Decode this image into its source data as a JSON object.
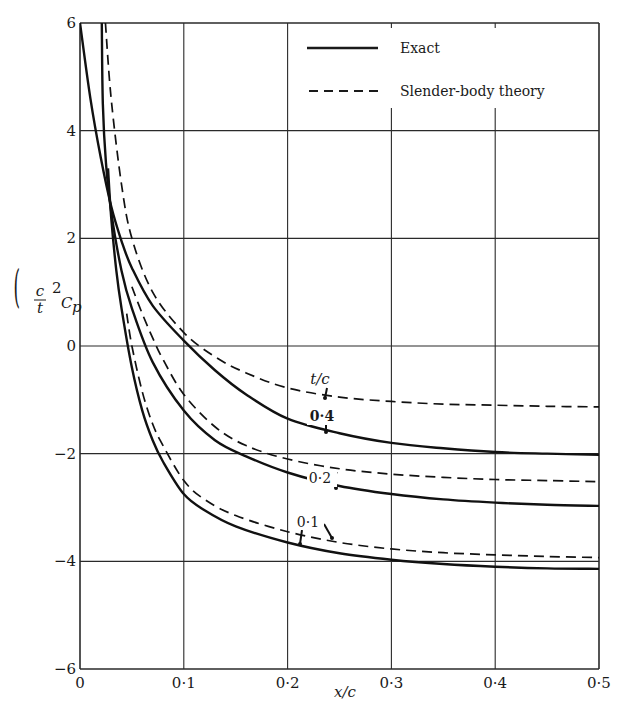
{
  "chart_data": {
    "type": "line",
    "title": "",
    "xlabel": "x/c",
    "ylabel": "(c/t)^2 C_p",
    "xlim": [
      0,
      0.5
    ],
    "ylim": [
      -6,
      6
    ],
    "grid": true,
    "x_ticks": [
      "0",
      "0·1",
      "0·2",
      "0·3",
      "0·4",
      "0·5"
    ],
    "y_ticks": [
      "6",
      "4",
      "2",
      "0",
      "−2",
      "−4",
      "−6"
    ],
    "legend": {
      "position": "upper right",
      "entries": [
        {
          "label": "Exact",
          "style": "solid"
        },
        {
          "label": "Slender-body theory",
          "style": "dashed"
        }
      ]
    },
    "annotations": [
      {
        "text": "t/c",
        "x": 0.235,
        "y": -0.6
      },
      {
        "text": "0·4",
        "x": 0.235,
        "y": -1.2
      },
      {
        "text": "0·2",
        "x": 0.22,
        "y": -2.8
      },
      {
        "text": "0·1",
        "x": 0.215,
        "y": -3.6
      }
    ],
    "series": [
      {
        "name": "Exact t/c=0.4",
        "style": "solid",
        "x": [
          0.0,
          0.01,
          0.02,
          0.03,
          0.04,
          0.05,
          0.07,
          0.1,
          0.13,
          0.16,
          0.2,
          0.25,
          0.3,
          0.35,
          0.4,
          0.45,
          0.5
        ],
        "values": [
          6.0,
          4.6,
          3.5,
          2.6,
          1.95,
          1.45,
          0.75,
          0.1,
          -0.45,
          -0.9,
          -1.35,
          -1.62,
          -1.8,
          -1.9,
          -1.97,
          -2.0,
          -2.02
        ]
      },
      {
        "name": "Slender-body t/c=0.4",
        "style": "dashed",
        "x": [
          0.0245,
          0.03,
          0.04,
          0.05,
          0.07,
          0.1,
          0.13,
          0.16,
          0.2,
          0.25,
          0.3,
          0.35,
          0.4,
          0.45,
          0.5
        ],
        "values": [
          6.0,
          4.6,
          3.0,
          2.0,
          1.0,
          0.25,
          -0.2,
          -0.5,
          -0.78,
          -0.95,
          -1.03,
          -1.08,
          -1.1,
          -1.12,
          -1.13
        ]
      },
      {
        "name": "Exact t/c=0.2",
        "style": "solid",
        "x": [
          0.021,
          0.022,
          0.025,
          0.03,
          0.04,
          0.05,
          0.07,
          0.1,
          0.13,
          0.16,
          0.2,
          0.25,
          0.3,
          0.35,
          0.4,
          0.45,
          0.5
        ],
        "values": [
          6.0,
          4.5,
          3.4,
          2.5,
          1.4,
          0.7,
          -0.3,
          -1.2,
          -1.75,
          -2.05,
          -2.35,
          -2.6,
          -2.75,
          -2.85,
          -2.91,
          -2.95,
          -2.97
        ]
      },
      {
        "name": "Slender-body t/c=0.2",
        "style": "dashed",
        "x": [
          0.05,
          0.06,
          0.07,
          0.08,
          0.1,
          0.13,
          0.16,
          0.2,
          0.25,
          0.3,
          0.35,
          0.4,
          0.45,
          0.5
        ],
        "values": [
          1.1,
          0.6,
          0.15,
          -0.25,
          -0.9,
          -1.5,
          -1.85,
          -2.1,
          -2.28,
          -2.38,
          -2.44,
          -2.48,
          -2.5,
          -2.52
        ]
      },
      {
        "name": "Exact t/c=0.1",
        "style": "solid",
        "x": [
          0.027,
          0.03,
          0.035,
          0.04,
          0.05,
          0.06,
          0.07,
          0.08,
          0.1,
          0.12,
          0.15,
          0.2,
          0.25,
          0.3,
          0.35,
          0.4,
          0.45,
          0.5
        ],
        "values": [
          3.3,
          2.4,
          1.4,
          0.7,
          -0.4,
          -1.2,
          -1.75,
          -2.15,
          -2.75,
          -3.05,
          -3.35,
          -3.65,
          -3.85,
          -3.97,
          -4.05,
          -4.1,
          -4.13,
          -4.14
        ]
      },
      {
        "name": "Slender-body t/c=0.1",
        "style": "dashed",
        "x": [
          0.045,
          0.05,
          0.06,
          0.07,
          0.08,
          0.1,
          0.12,
          0.15,
          0.2,
          0.25,
          0.3,
          0.35,
          0.4,
          0.45,
          0.5
        ],
        "values": [
          0.6,
          0.0,
          -0.85,
          -1.45,
          -1.85,
          -2.5,
          -2.85,
          -3.15,
          -3.45,
          -3.65,
          -3.77,
          -3.84,
          -3.88,
          -3.91,
          -3.93
        ]
      }
    ]
  },
  "text": {
    "xlabel": "x/c",
    "ylabel_main": "C",
    "ylabel_sub": "p",
    "ylabel_frac_num": "c",
    "ylabel_frac_den": "t",
    "ylabel_exp": "2",
    "legend_exact": "Exact",
    "legend_sbt": "Slender-body theory",
    "annot_tc": "t/c",
    "annot_04": "0·4",
    "annot_02": "0·2",
    "annot_01": "0·1"
  }
}
